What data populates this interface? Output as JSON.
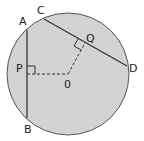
{
  "diagram": {
    "colors": {
      "fill": "#d3d3d3",
      "stroke": "#333333",
      "background": "#ffffff"
    },
    "labels": {
      "A": "A",
      "B": "B",
      "C": "C",
      "D": "D",
      "P": "P",
      "Q": "Q",
      "O": "0"
    }
  }
}
